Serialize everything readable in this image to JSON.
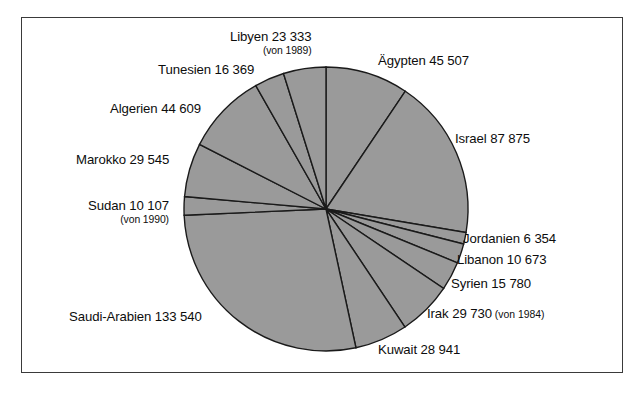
{
  "figure": {
    "kind": "pie-chart",
    "frame_border_color": "#3a3a3a",
    "background_color": "#ffffff",
    "slice_fill_color": "#9a9a9a",
    "slice_stroke_color": "#1a1a1a"
  },
  "chart_data": {
    "type": "pie",
    "title": "",
    "xlabel": "",
    "ylabel": "",
    "grid": false,
    "legend_position": "none",
    "label_format": "name value (note)",
    "start_angle_deg": -90,
    "direction": "clockwise",
    "total": 482363,
    "categories": [
      "Ägypten",
      "Israel",
      "Jordanien",
      "Libanon",
      "Syrien",
      "Irak",
      "Kuwait",
      "Saudi-Arabien",
      "Sudan",
      "Marokko",
      "Algerien",
      "Tunesien",
      "Libyen"
    ],
    "values": [
      45507,
      87875,
      6354,
      10673,
      15780,
      29730,
      28941,
      133540,
      10107,
      29545,
      44609,
      16369,
      23333
    ],
    "slices": [
      {
        "name": "Ägypten",
        "value": 45507,
        "value_text": "45 507",
        "note": "",
        "label": "Ägypten 45 507",
        "label_x": 378,
        "label_y": 53,
        "align": "left",
        "two_line": false
      },
      {
        "name": "Israel",
        "value": 87875,
        "value_text": "87 875",
        "note": "",
        "label": "Israel 87 875",
        "label_x": 455,
        "label_y": 131,
        "align": "left",
        "two_line": false
      },
      {
        "name": "Jordanien",
        "value": 6354,
        "value_text": "6 354",
        "note": "",
        "label": "Jordanien 6 354",
        "label_x": 463,
        "label_y": 231,
        "align": "left",
        "two_line": false
      },
      {
        "name": "Libanon",
        "value": 10673,
        "value_text": "10 673",
        "note": "",
        "label": "Libanon 10 673",
        "label_x": 457,
        "label_y": 252,
        "align": "left",
        "two_line": false
      },
      {
        "name": "Syrien",
        "value": 15780,
        "value_text": "15 780",
        "note": "",
        "label": "Syrien 15 780",
        "label_x": 451,
        "label_y": 276,
        "align": "left",
        "two_line": false
      },
      {
        "name": "Irak",
        "value": 29730,
        "value_text": "29 730",
        "note": "(von 1984)",
        "label": "Irak 29 730",
        "label_x": 427,
        "label_y": 306,
        "align": "left",
        "two_line": false
      },
      {
        "name": "Kuwait",
        "value": 28941,
        "value_text": "28 941",
        "note": "",
        "label": "Kuwait 28 941",
        "label_x": 378,
        "label_y": 342,
        "align": "left",
        "two_line": false
      },
      {
        "name": "Saudi-Arabien",
        "value": 133540,
        "value_text": "133 540",
        "note": "",
        "label": "Saudi-Arabien 133 540",
        "label_x": 69,
        "label_y": 309,
        "align": "left",
        "two_line": false
      },
      {
        "name": "Sudan",
        "value": 10107,
        "value_text": "10 107",
        "note": "(von 1990)",
        "label": "Sudan 10 107",
        "label_x": 88,
        "label_y": 199,
        "align": "left",
        "two_line": true
      },
      {
        "name": "Marokko",
        "value": 29545,
        "value_text": "29 545",
        "note": "",
        "label": "Marokko 29 545",
        "label_x": 76,
        "label_y": 152,
        "align": "left",
        "two_line": false
      },
      {
        "name": "Algerien",
        "value": 44609,
        "value_text": "44 609",
        "note": "",
        "label": "Algerien 44 609",
        "label_x": 110,
        "label_y": 101,
        "align": "left",
        "two_line": false
      },
      {
        "name": "Tunesien",
        "value": 16369,
        "value_text": "16 369",
        "note": "",
        "label": "Tunesien 16 369",
        "label_x": 158,
        "label_y": 62,
        "align": "left",
        "two_line": false
      },
      {
        "name": "Libyen",
        "value": 23333,
        "value_text": "23 333",
        "note": "(von 1989)",
        "label": "Libyen 23 333",
        "label_x": 230,
        "label_y": 30,
        "align": "left",
        "two_line": true
      }
    ],
    "geometry": {
      "center_x": 326,
      "center_y": 209,
      "radius": 142
    }
  }
}
